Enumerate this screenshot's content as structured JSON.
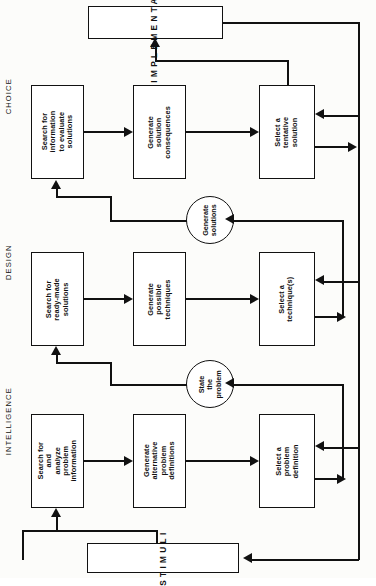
{
  "figure": {
    "type": "flowchart",
    "orientation": "rotated-90-ccw",
    "title_text": ""
  },
  "terminals": {
    "stimuli": "STIMULI",
    "implementation": "IMPLEMENTATION"
  },
  "phases": [
    {
      "id": "intelligence",
      "label": "INTELLIGENCE"
    },
    {
      "id": "design",
      "label": "DESIGN"
    },
    {
      "id": "choice",
      "label": "CHOICE"
    }
  ],
  "boxes": {
    "intelligence": [
      {
        "id": "i1",
        "label": "Search for and\nanalyze\nproblem\ninformation"
      },
      {
        "id": "i2",
        "label": "Generate\nalternative\nproblem\ndefinitions"
      },
      {
        "id": "i3",
        "label": "Select a\nproblem\ndefinition"
      }
    ],
    "design": [
      {
        "id": "d1",
        "label": "Search for\nready-made\nsolutions"
      },
      {
        "id": "d2",
        "label": "Generate\npossible\ntechniques"
      },
      {
        "id": "d3",
        "label": "Select a\ntechnique(s)"
      }
    ],
    "choice": [
      {
        "id": "c1",
        "label": "Search for\ninformation\nto evaluate\nsolutions"
      },
      {
        "id": "c2",
        "label": "Generate\nsolution\nconsequences"
      },
      {
        "id": "c3",
        "label": "Select a\ntentative\nsolution"
      }
    ]
  },
  "connectors": [
    {
      "id": "state-the-problem",
      "label": "State\nthe\nproblem"
    },
    {
      "id": "generate-solutions",
      "label": "Generate\nsolutions"
    }
  ],
  "colors": {
    "stroke": "#111111",
    "fill": "#ffffff",
    "page": "#fcfcfa"
  }
}
